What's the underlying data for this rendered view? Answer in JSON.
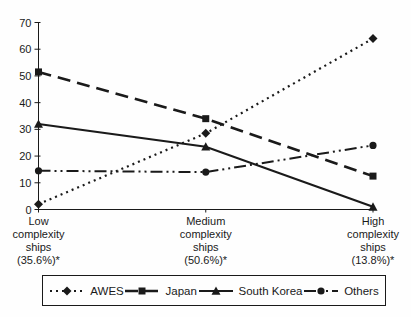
{
  "chart_data": {
    "type": "line",
    "title": "",
    "xlabel": "",
    "ylabel": "",
    "ylim": [
      0,
      70
    ],
    "yticks": [
      0,
      10,
      20,
      30,
      40,
      50,
      60,
      70
    ],
    "grid": false,
    "legend_position": "bottom",
    "line_color": "#1a1a1a",
    "categories": [
      "Low complexity ships (35.6%)*",
      "Medium complexity ships (50.6%)*",
      "High complexity ships (13.8%)*"
    ],
    "category_display_lines": [
      [
        "Low",
        "complexity",
        "ships",
        "(35.6%)*"
      ],
      [
        "Medium",
        "complexity",
        "ships",
        "(50.6%)*"
      ],
      [
        "High",
        "complexity",
        "ships",
        "(13.8%)*"
      ]
    ],
    "series": [
      {
        "name": "AWES",
        "values": [
          2,
          28.5,
          64
        ],
        "line_style": "dotted",
        "marker": "diamond"
      },
      {
        "name": "Japan",
        "values": [
          51.5,
          34,
          12.5
        ],
        "line_style": "dashed",
        "marker": "square"
      },
      {
        "name": "South Korea",
        "values": [
          32,
          23.5,
          1
        ],
        "line_style": "solid",
        "marker": "triangle"
      },
      {
        "name": "Others",
        "values": [
          14.5,
          14,
          24
        ],
        "line_style": "dashdot",
        "marker": "circle"
      }
    ]
  }
}
